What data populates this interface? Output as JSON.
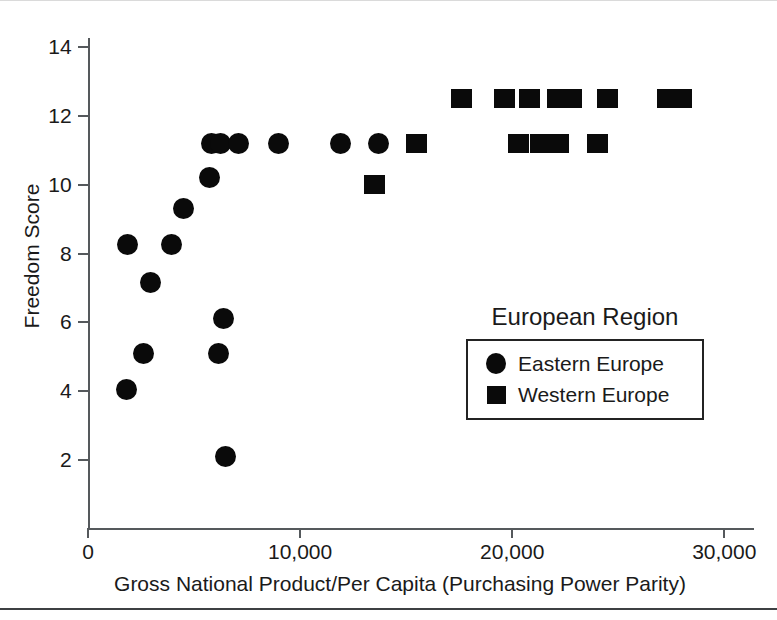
{
  "chart_data": {
    "type": "scatter",
    "title": "",
    "xlabel": "Gross National Product/Per Capita (Purchasing Power Parity)",
    "ylabel": "Freedom Score",
    "xlim": [
      0,
      31400
    ],
    "ylim": [
      0.6,
      14.7
    ],
    "grid": false,
    "legend_position": "inside-lower-right",
    "legend_title": "European Region",
    "x_ticks": [
      0,
      10000,
      20000,
      30000
    ],
    "x_tick_labels": [
      "0",
      "10,000",
      "20,000",
      "30,000"
    ],
    "y_ticks": [
      2,
      4,
      6,
      8,
      10,
      12,
      14
    ],
    "y_tick_labels": [
      "2",
      "4",
      "6",
      "8",
      "10",
      "12",
      "14"
    ],
    "series": [
      {
        "name": "Eastern Europe",
        "marker": "circle",
        "color": "#0a0a0a",
        "points": [
          {
            "x": 1800,
            "y": 4.05
          },
          {
            "x": 1850,
            "y": 8.25
          },
          {
            "x": 2600,
            "y": 5.1
          },
          {
            "x": 2950,
            "y": 7.15
          },
          {
            "x": 3950,
            "y": 8.25
          },
          {
            "x": 4500,
            "y": 9.3
          },
          {
            "x": 5750,
            "y": 10.2
          },
          {
            "x": 5800,
            "y": 11.2
          },
          {
            "x": 6150,
            "y": 5.1
          },
          {
            "x": 6250,
            "y": 11.2
          },
          {
            "x": 6400,
            "y": 6.1
          },
          {
            "x": 6500,
            "y": 2.1
          },
          {
            "x": 7100,
            "y": 11.2
          },
          {
            "x": 9000,
            "y": 11.2
          },
          {
            "x": 11900,
            "y": 11.2
          },
          {
            "x": 13700,
            "y": 11.2
          }
        ]
      },
      {
        "name": "Western Europe",
        "marker": "square",
        "color": "#0a0a0a",
        "points": [
          {
            "x": 13500,
            "y": 10.0
          },
          {
            "x": 15500,
            "y": 11.2
          },
          {
            "x": 17600,
            "y": 12.5
          },
          {
            "x": 19650,
            "y": 12.5
          },
          {
            "x": 20300,
            "y": 11.2
          },
          {
            "x": 20800,
            "y": 12.5
          },
          {
            "x": 21350,
            "y": 11.2
          },
          {
            "x": 22200,
            "y": 11.2
          },
          {
            "x": 22150,
            "y": 12.5
          },
          {
            "x": 22800,
            "y": 12.5
          },
          {
            "x": 24000,
            "y": 11.2
          },
          {
            "x": 24500,
            "y": 12.5
          },
          {
            "x": 27300,
            "y": 12.5
          },
          {
            "x": 28000,
            "y": 12.5
          }
        ]
      }
    ]
  },
  "legend": {
    "title": "European Region",
    "entries": [
      {
        "label": "Eastern Europe",
        "marker": "circle"
      },
      {
        "label": "Western Europe",
        "marker": "square"
      }
    ]
  },
  "axes": {
    "x_title": "Gross National Product/Per Capita (Purchasing Power Parity)",
    "y_title": "Freedom Score"
  }
}
